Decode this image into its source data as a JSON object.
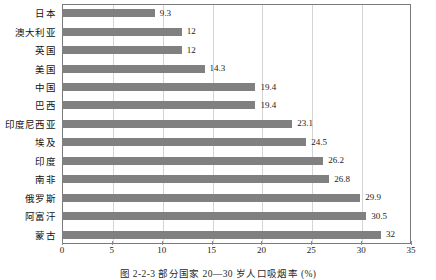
{
  "chart_data": {
    "type": "bar",
    "orientation": "horizontal",
    "title": "",
    "xlabel": "",
    "ylabel": "",
    "xlim": [
      0,
      35
    ],
    "xticks": [
      0,
      5,
      10,
      15,
      20,
      25,
      30,
      35
    ],
    "grid": "vertical",
    "legend": "none",
    "bar_color": "#808080",
    "categories": [
      "日本",
      "澳大利亚",
      "英国",
      "美国",
      "中国",
      "巴西",
      "印度尼西亚",
      "埃及",
      "印度",
      "南非",
      "俄罗斯",
      "阿富汗",
      "蒙古"
    ],
    "values": [
      9.3,
      12,
      12,
      14.3,
      19.4,
      19.4,
      23.1,
      24.5,
      26.2,
      26.8,
      29.9,
      30.5,
      32
    ],
    "value_labels": [
      "9.3",
      "12",
      "12",
      "14.3",
      "19.4",
      "19.4",
      "23.1",
      "24.5",
      "26.2",
      "26.8",
      "29.9",
      "30.5",
      "32"
    ]
  },
  "caption": {
    "text": "图 2-2-3   部分国家 20—30 岁人口吸烟率 (%)"
  }
}
